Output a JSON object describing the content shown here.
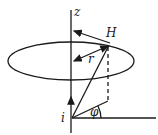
{
  "diagram": {
    "labels": {
      "z_axis": "z",
      "field": "H",
      "radius": "r",
      "current": "i",
      "angle": "φ"
    },
    "elements": [
      {
        "type": "axis",
        "name": "z-axis",
        "direction": "vertical"
      },
      {
        "type": "ellipse",
        "name": "circular field line",
        "around": "z-axis"
      },
      {
        "type": "vector",
        "name": "H",
        "direction": "tangent to circle"
      },
      {
        "type": "vector",
        "name": "r",
        "double_headed": true
      },
      {
        "type": "line",
        "name": "position vector from i to H"
      },
      {
        "type": "dashed-line",
        "name": "projection of H onto horizontal plane"
      },
      {
        "type": "line",
        "name": "horizontal reference"
      },
      {
        "type": "angle",
        "name": "phi"
      }
    ],
    "colors": {
      "stroke": "#1a1a1a",
      "background": "#ffffff"
    }
  }
}
